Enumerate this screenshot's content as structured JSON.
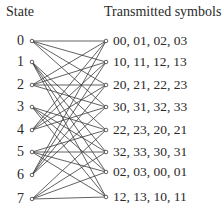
{
  "headers": {
    "left": "State",
    "right": "Transmitted symbols"
  },
  "states": [
    "0",
    "1",
    "2",
    "3",
    "4",
    "5",
    "6",
    "7"
  ],
  "symbols": [
    "00, 01, 02, 03",
    "10, 11, 12, 13",
    "20, 21, 22, 23",
    "30, 31, 32, 33",
    "22, 23, 20, 21",
    "32, 33, 30, 31",
    "02, 03, 00, 01",
    "12, 13, 10, 11"
  ],
  "layout": {
    "left_x": 32,
    "right_x": 106,
    "left_y": [
      41,
      62,
      85,
      107,
      130,
      152,
      175,
      199
    ],
    "right_y": [
      41,
      62,
      85,
      107,
      130,
      152,
      172,
      197
    ]
  },
  "transitions": [
    [
      0,
      1,
      2,
      3
    ],
    [
      4,
      5,
      6,
      7
    ],
    [
      0,
      1,
      2,
      3
    ],
    [
      4,
      5,
      6,
      7
    ],
    [
      0,
      1,
      2,
      3
    ],
    [
      4,
      5,
      6,
      7
    ],
    [
      0,
      1,
      2,
      3
    ],
    [
      4,
      5,
      6,
      7
    ]
  ],
  "colors": {
    "line": "#3a3a3a",
    "text": "#2a2a2a"
  }
}
